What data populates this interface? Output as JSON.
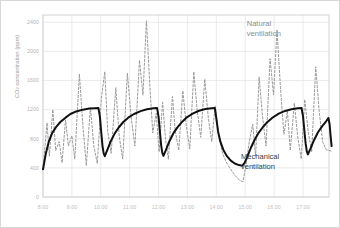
{
  "chart_data": {
    "type": "line",
    "title": "",
    "subtitle": "",
    "xlabel": "",
    "ylabel": "CO2 concentration (ppm)",
    "ylabel_parts": {
      "prefix": "CO",
      "sub": "2",
      "suffix": " concentration (ppm)"
    },
    "grid": true,
    "legend_position": "in-plot annotations",
    "xlim": [
      8.0,
      17.9
    ],
    "ylim": [
      0,
      2500
    ],
    "yticks": [
      0,
      400,
      800,
      1200,
      1600,
      2000,
      2400
    ],
    "ytick_labels": [
      "0",
      "400",
      "800",
      "1200",
      "1600",
      "2000",
      "2400"
    ],
    "xticks": [
      8,
      9,
      10,
      11,
      12,
      13,
      14,
      15,
      16,
      17
    ],
    "xtick_labels": [
      "8:00",
      "9:00",
      "10:00",
      "11:00",
      "12:00",
      "13:00",
      "14:00",
      "15:00",
      "16:00",
      "17:00"
    ],
    "annotations": [
      {
        "id": "natural",
        "text_line1": "Natural",
        "text_line2": "ventilation",
        "color": "#8e8e8e"
      },
      {
        "id": "mechanical",
        "text_line1": "Mechanical",
        "text_line2": "ventilation",
        "color": "#3a3a3a"
      }
    ],
    "series": [
      {
        "name": "Mechanical ventilation",
        "style": "solid",
        "color": "#111111",
        "width": 2.0,
        "points": [
          [
            8.0,
            380
          ],
          [
            8.1,
            600
          ],
          [
            8.2,
            760
          ],
          [
            8.32,
            880
          ],
          [
            8.45,
            960
          ],
          [
            8.6,
            1030
          ],
          [
            8.78,
            1090
          ],
          [
            8.95,
            1140
          ],
          [
            9.15,
            1175
          ],
          [
            9.38,
            1200
          ],
          [
            9.6,
            1215
          ],
          [
            9.8,
            1220
          ],
          [
            9.92,
            1222
          ],
          [
            9.97,
            1100
          ],
          [
            10.02,
            870
          ],
          [
            10.06,
            700
          ],
          [
            10.1,
            600
          ],
          [
            10.14,
            560
          ],
          [
            10.22,
            640
          ],
          [
            10.34,
            760
          ],
          [
            10.48,
            870
          ],
          [
            10.62,
            955
          ],
          [
            10.78,
            1030
          ],
          [
            10.95,
            1090
          ],
          [
            11.15,
            1140
          ],
          [
            11.38,
            1180
          ],
          [
            11.6,
            1205
          ],
          [
            11.82,
            1218
          ],
          [
            11.95,
            1222
          ],
          [
            12.0,
            1100
          ],
          [
            12.05,
            880
          ],
          [
            12.09,
            710
          ],
          [
            12.13,
            605
          ],
          [
            12.17,
            565
          ],
          [
            12.26,
            650
          ],
          [
            12.38,
            770
          ],
          [
            12.52,
            880
          ],
          [
            12.66,
            960
          ],
          [
            12.82,
            1035
          ],
          [
            12.98,
            1095
          ],
          [
            13.18,
            1145
          ],
          [
            13.4,
            1185
          ],
          [
            13.62,
            1208
          ],
          [
            13.84,
            1219
          ],
          [
            13.95,
            1222
          ],
          [
            14.0,
            1080
          ],
          [
            14.06,
            900
          ],
          [
            14.14,
            760
          ],
          [
            14.24,
            650
          ],
          [
            14.36,
            565
          ],
          [
            14.5,
            500
          ],
          [
            14.64,
            460
          ],
          [
            14.78,
            438
          ],
          [
            14.9,
            430
          ],
          [
            14.98,
            470
          ],
          [
            15.08,
            560
          ],
          [
            15.2,
            680
          ],
          [
            15.33,
            790
          ],
          [
            15.47,
            885
          ],
          [
            15.62,
            965
          ],
          [
            15.78,
            1035
          ],
          [
            15.96,
            1095
          ],
          [
            16.16,
            1145
          ],
          [
            16.38,
            1182
          ],
          [
            16.6,
            1205
          ],
          [
            16.82,
            1218
          ],
          [
            16.95,
            1222
          ],
          [
            17.0,
            1110
          ],
          [
            17.05,
            900
          ],
          [
            17.09,
            740
          ],
          [
            17.13,
            630
          ],
          [
            17.17,
            585
          ],
          [
            17.26,
            665
          ],
          [
            17.38,
            780
          ],
          [
            17.52,
            890
          ],
          [
            17.66,
            970
          ],
          [
            17.8,
            1040
          ],
          [
            17.88,
            1085
          ],
          [
            17.92,
            1000
          ],
          [
            17.95,
            860
          ],
          [
            17.99,
            700
          ]
        ]
      },
      {
        "name": "Natural ventilation",
        "style": "dashed",
        "color": "#9a9a9a",
        "width": 1.0,
        "dash": "2.2 1.8",
        "points": [
          [
            8.0,
            380
          ],
          [
            8.14,
            1020
          ],
          [
            8.22,
            560
          ],
          [
            8.34,
            1200
          ],
          [
            8.44,
            640
          ],
          [
            8.56,
            760
          ],
          [
            8.66,
            470
          ],
          [
            8.78,
            1060
          ],
          [
            8.88,
            700
          ],
          [
            9.0,
            840
          ],
          [
            9.1,
            520
          ],
          [
            9.26,
            1690
          ],
          [
            9.38,
            980
          ],
          [
            9.5,
            430
          ],
          [
            9.64,
            1230
          ],
          [
            9.76,
            700
          ],
          [
            9.88,
            460
          ],
          [
            10.02,
            1360
          ],
          [
            10.14,
            1720
          ],
          [
            10.24,
            900
          ],
          [
            10.36,
            600
          ],
          [
            10.52,
            1500
          ],
          [
            10.64,
            830
          ],
          [
            10.76,
            520
          ],
          [
            10.92,
            1700
          ],
          [
            11.05,
            1100
          ],
          [
            11.18,
            700
          ],
          [
            11.34,
            1880
          ],
          [
            11.46,
            1400
          ],
          [
            11.58,
            2420
          ],
          [
            11.7,
            1520
          ],
          [
            11.8,
            880
          ],
          [
            11.92,
            1150
          ],
          [
            12.02,
            620
          ],
          [
            12.14,
            1300
          ],
          [
            12.24,
            800
          ],
          [
            12.34,
            520
          ],
          [
            12.48,
            1380
          ],
          [
            12.58,
            900
          ],
          [
            12.7,
            640
          ],
          [
            12.84,
            1460
          ],
          [
            12.96,
            980
          ],
          [
            13.08,
            660
          ],
          [
            13.22,
            1720
          ],
          [
            13.34,
            1180
          ],
          [
            13.46,
            820
          ],
          [
            13.6,
            1620
          ],
          [
            13.72,
            1100
          ],
          [
            13.84,
            760
          ],
          [
            13.96,
            1250
          ],
          [
            14.06,
            900
          ],
          [
            14.2,
            620
          ],
          [
            14.34,
            480
          ],
          [
            14.5,
            380
          ],
          [
            14.64,
            300
          ],
          [
            14.8,
            230
          ],
          [
            14.92,
            210
          ],
          [
            15.02,
            420
          ],
          [
            15.14,
            760
          ],
          [
            15.26,
            1000
          ],
          [
            15.36,
            560
          ],
          [
            15.48,
            1650
          ],
          [
            15.6,
            1100
          ],
          [
            15.72,
            700
          ],
          [
            15.86,
            1900
          ],
          [
            15.98,
            1400
          ],
          [
            16.1,
            2300
          ],
          [
            16.22,
            1500
          ],
          [
            16.34,
            860
          ],
          [
            16.46,
            1180
          ],
          [
            16.56,
            640
          ],
          [
            16.7,
            1290
          ],
          [
            16.82,
            820
          ],
          [
            16.94,
            520
          ],
          [
            17.06,
            1340
          ],
          [
            17.18,
            900
          ],
          [
            17.3,
            620
          ],
          [
            17.44,
            1790
          ],
          [
            17.56,
            1180
          ],
          [
            17.68,
            760
          ],
          [
            17.8,
            650
          ],
          [
            17.9,
            640
          ],
          [
            17.99,
            630
          ]
        ]
      }
    ]
  }
}
